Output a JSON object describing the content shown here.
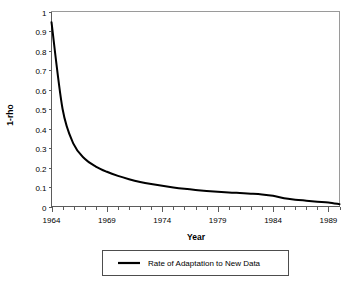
{
  "chart_data": {
    "type": "line",
    "title": "",
    "xlabel": "Year",
    "ylabel": "1-rho",
    "xlim": [
      1964,
      1990
    ],
    "ylim": [
      0,
      1
    ],
    "grid": false,
    "legend_position": "bottom",
    "x_ticks": [
      1964,
      1969,
      1974,
      1979,
      1984,
      1989
    ],
    "x_tick_labels": [
      "1964",
      "1969",
      "1974",
      "1979",
      "1984",
      "1989"
    ],
    "x_minor_tick_interval": 1,
    "y_ticks": [
      0,
      0.1,
      0.2,
      0.3,
      0.4,
      0.5,
      0.6,
      0.7,
      0.8,
      0.9,
      1
    ],
    "y_tick_labels": [
      "0",
      "0.1",
      "0.2",
      "0.3",
      "0.4",
      "0.5",
      "0.6",
      "0.7",
      "0.8",
      "0.9",
      "1"
    ],
    "series": [
      {
        "name": "Rate of Adaptation to New Data",
        "color": "#000000",
        "x": [
          1964,
          1965,
          1966,
          1967,
          1968,
          1969,
          1970,
          1971,
          1972,
          1973,
          1974,
          1975,
          1976,
          1977,
          1978,
          1979,
          1980,
          1981,
          1982,
          1983,
          1984,
          1985,
          1986,
          1987,
          1988,
          1989,
          1990
        ],
        "values": [
          0.945,
          0.5,
          0.32,
          0.245,
          0.205,
          0.178,
          0.157,
          0.14,
          0.126,
          0.115,
          0.106,
          0.098,
          0.091,
          0.085,
          0.08,
          0.076,
          0.072,
          0.069,
          0.066,
          0.062,
          0.055,
          0.042,
          0.035,
          0.03,
          0.025,
          0.021,
          0.012
        ]
      }
    ]
  },
  "legend": {
    "entries": [
      {
        "label": "Rate of Adaptation to New Data"
      }
    ]
  },
  "axes": {
    "x_title": "Year",
    "y_title": "1-rho"
  }
}
